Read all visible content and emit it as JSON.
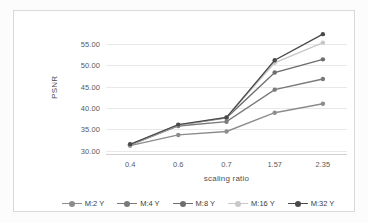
{
  "chart_data": {
    "type": "line",
    "title": "",
    "xlabel": "scaling ratio",
    "ylabel": "PSNR",
    "categories": [
      "0.4",
      "0.6",
      "0.7",
      "1.57",
      "2.35"
    ],
    "yticks": [
      "30.00",
      "35.00",
      "40.00",
      "45.00",
      "50.00",
      "55.00"
    ],
    "ylim": [
      29.0,
      58.5
    ],
    "grid": true,
    "legend_position": "bottom",
    "series": [
      {
        "name": "M:2 Y",
        "color": "#8c8c8c",
        "values": [
          31.2,
          33.7,
          34.5,
          38.9,
          41.0
        ]
      },
      {
        "name": "M:4 Y",
        "color": "#7a7a7a",
        "values": [
          31.3,
          35.8,
          36.8,
          44.3,
          46.8
        ]
      },
      {
        "name": "M:8 Y",
        "color": "#6e6e6e",
        "values": [
          31.4,
          36.0,
          37.7,
          48.3,
          51.4
        ]
      },
      {
        "name": "M:16 Y",
        "color": "#c8c8c8",
        "values": [
          31.4,
          36.0,
          37.8,
          50.6,
          55.3
        ]
      },
      {
        "name": "M:32 Y",
        "color": "#4a4a4a",
        "values": [
          31.5,
          36.1,
          37.8,
          51.2,
          57.3
        ]
      }
    ]
  },
  "legend": {
    "items": [
      {
        "label": "M:2 Y"
      },
      {
        "label": "M:4 Y"
      },
      {
        "label": "M:8 Y"
      },
      {
        "label": "M:16 Y"
      },
      {
        "label": "M:32 Y"
      }
    ]
  }
}
